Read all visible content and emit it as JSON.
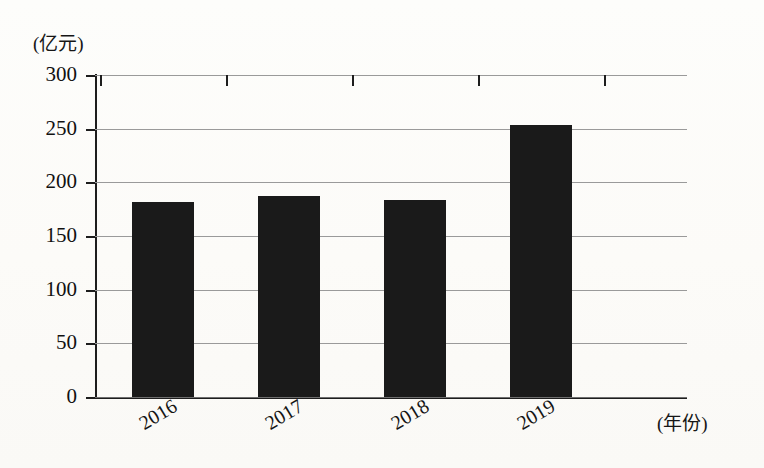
{
  "axes": {
    "y_unit_label": "(亿元)",
    "x_unit_label": "(年份)",
    "y_ticks": [
      "0",
      "50",
      "100",
      "150",
      "200",
      "250",
      "300"
    ]
  },
  "colors": {
    "bar": "#1a1a1a",
    "gridline": "#9a9a9a",
    "axis": "#1d1d1d",
    "background": "#fdfdfb",
    "text": "#111111"
  },
  "chart_data": {
    "type": "bar",
    "title": "",
    "subtitle": "",
    "xlabel": "(年份)",
    "ylabel": "(亿元)",
    "categories": [
      "2016",
      "2017",
      "2018",
      "2019"
    ],
    "values": [
      182,
      187,
      184,
      253
    ],
    "ylim": [
      0,
      300
    ],
    "ytick_step": 50,
    "yticks": [
      0,
      50,
      100,
      150,
      200,
      250,
      300
    ],
    "grid": true,
    "legend": false,
    "legend_position": "none",
    "series": [
      {
        "name": "金额",
        "values": [
          182,
          187,
          184,
          253
        ]
      }
    ],
    "annotations": []
  }
}
